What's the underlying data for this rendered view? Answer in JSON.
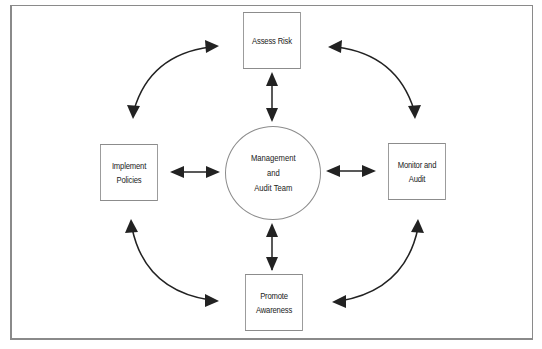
{
  "diagram": {
    "type": "cycle-hub",
    "center": {
      "label": "Management\nand\nAudit Team"
    },
    "nodes": [
      {
        "id": "assess",
        "label": "Assess Risk",
        "position": "top"
      },
      {
        "id": "implement",
        "label": "Implement\nPolicies",
        "position": "left"
      },
      {
        "id": "monitor",
        "label": "Monitor and\nAudit",
        "position": "right"
      },
      {
        "id": "promote",
        "label": "Promote\nAwareness",
        "position": "bottom"
      }
    ],
    "edges": [
      {
        "from": "center",
        "to": "assess",
        "style": "double-arrow-straight"
      },
      {
        "from": "center",
        "to": "implement",
        "style": "double-arrow-straight"
      },
      {
        "from": "center",
        "to": "monitor",
        "style": "double-arrow-straight"
      },
      {
        "from": "center",
        "to": "promote",
        "style": "double-arrow-straight"
      },
      {
        "from": "implement",
        "to": "assess",
        "style": "double-arrow-curved"
      },
      {
        "from": "assess",
        "to": "monitor",
        "style": "double-arrow-curved"
      },
      {
        "from": "implement",
        "to": "promote",
        "style": "double-arrow-curved"
      },
      {
        "from": "monitor",
        "to": "promote",
        "style": "double-arrow-curved"
      }
    ],
    "colors": {
      "stroke": "#222222",
      "box_border": "#8c8c8c",
      "frame": "#8a8a8a"
    }
  }
}
